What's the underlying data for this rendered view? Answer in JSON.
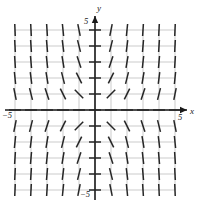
{
  "figure": {
    "kind": "slope-field",
    "width": 202,
    "height": 208,
    "background": "#ffffff"
  },
  "axes": {
    "x_axis_label": "x",
    "y_axis_label": "y",
    "x_tick_left_label": "−5",
    "x_tick_right_label": "5",
    "y_tick_top_label": "5",
    "y_tick_bottom_label": "−5",
    "axis_color": "#1a1a1a",
    "grid_color": "#b5b5b5",
    "segment_color": "#262626",
    "arrow_color": "#1a1a1a"
  },
  "chart_data": {
    "type": "scatter",
    "title": "",
    "xlabel": "x",
    "ylabel": "y",
    "xlim": [
      -5,
      5
    ],
    "ylim": [
      -5,
      5
    ],
    "grid": true,
    "grid_step": 1,
    "legend": "none",
    "slope_rule": "m = x*y",
    "sample_x": [
      -5,
      -4,
      -3,
      -2,
      -1,
      0,
      1,
      2,
      3,
      4,
      5
    ],
    "sample_y": [
      -5,
      -4,
      -3,
      -2,
      -1,
      0,
      1,
      2,
      3,
      4,
      5
    ],
    "tick_labels_x": [
      "−5",
      "5"
    ],
    "tick_labels_y": [
      "−5",
      "5"
    ],
    "segment_half_length_px": 6,
    "unit_px": 16,
    "origin_px": [
      95,
      110
    ]
  }
}
